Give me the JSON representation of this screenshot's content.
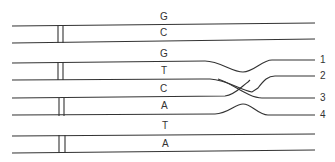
{
  "diagram": {
    "base_labels": [
      "G",
      "C",
      "G",
      "T",
      "C",
      "A",
      "T",
      "A"
    ],
    "strand_numbers": [
      "1",
      "2",
      "3",
      "4"
    ],
    "colors": {
      "line": "#333333",
      "background": "#ffffff"
    }
  }
}
